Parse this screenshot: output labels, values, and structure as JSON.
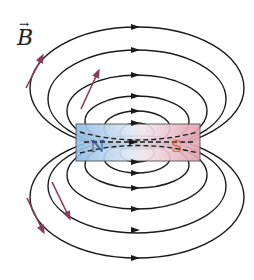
{
  "diagram": {
    "field_label": "B",
    "field_label_vector_mark": "→",
    "magnet": {
      "north_label": "N",
      "south_label": "S",
      "north_color": "#9cc3e6",
      "south_color": "#e6a9b4",
      "north_text_color": "#3b4a8a",
      "south_text_color": "#e0602a"
    },
    "field_line_color": "#1a1a1a",
    "vector_arrow_color": "#8b3a5a",
    "top_loops": 6,
    "bottom_loops": 6,
    "arrow_direction": "right"
  }
}
